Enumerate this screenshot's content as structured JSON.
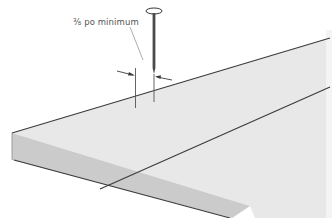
{
  "diagram": {
    "type": "technical-illustration",
    "annotation": {
      "text": "⅜ po minimum"
    },
    "colors": {
      "background": "#ffffff",
      "panel_top": "#e8e8e8",
      "panel_front": "#c9c9c9",
      "panel_side": "#d4d4d4",
      "outline": "#3a3a3a",
      "nail": "#4a4a4a",
      "leader_line": "#8a8a8a"
    }
  }
}
